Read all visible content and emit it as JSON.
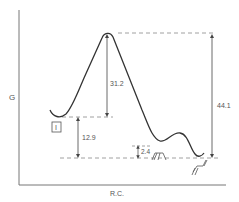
{
  "diagram": {
    "type": "reaction-energy-profile",
    "y_axis_label": "G",
    "x_axis_label": "R.C.",
    "species": {
      "reactant_label": "I",
      "intermediate_label": "II",
      "product_label": "III"
    },
    "energy_gaps": {
      "activation_barrier": "31.2",
      "reactant_to_product": "12.9",
      "intermediate_barrier": "2.4",
      "overall_peak_to_product": "44.1"
    },
    "colors": {
      "curve": "#333333",
      "axis": "#777777",
      "dashed": "#888888",
      "text": "#555555"
    }
  }
}
